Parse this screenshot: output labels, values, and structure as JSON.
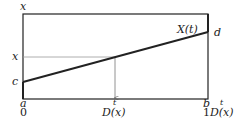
{
  "diagram": {
    "axis_label_y": "x",
    "curve_label": "X(t)",
    "left_labels": {
      "x_level": "x",
      "c": "c"
    },
    "right_label": "d",
    "bottom_labels": {
      "a": "a",
      "zero": "0",
      "t_mid": "t",
      "D_mid": "D(x)",
      "b": "b",
      "t_right": "t",
      "one": "1",
      "D_right": "D(x)"
    },
    "colors": {
      "frame": "#222222",
      "guide": "#888888",
      "line": "#222222"
    }
  }
}
